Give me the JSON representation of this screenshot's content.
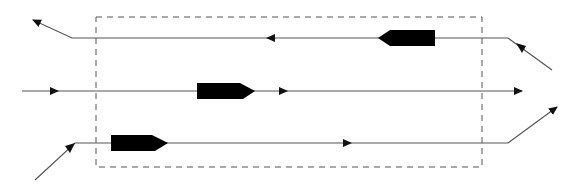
{
  "diagram": {
    "type": "vessel-traffic-lanes",
    "colors": {
      "background": "#ffffff",
      "line": "#555555",
      "ship": "#000000",
      "dashed_box": "#555555"
    },
    "zone": {
      "x": 96,
      "y": 17,
      "width": 386,
      "height": 150,
      "style": "dashed"
    },
    "lanes": [
      {
        "id": "top",
        "direction": "right-to-left",
        "points": [
          [
            552,
            70
          ],
          [
            508,
            38
          ],
          [
            72,
            38
          ],
          [
            33,
            20
          ]
        ],
        "mid_arrows": [
          {
            "x": 270,
            "y": 38,
            "dir": "left"
          }
        ],
        "ship": {
          "x": 378,
          "y": 38,
          "length": 57,
          "heading": "left"
        }
      },
      {
        "id": "middle",
        "direction": "left-to-right",
        "points": [
          [
            22,
            91
          ],
          [
            522,
            91
          ]
        ],
        "mid_arrows": [
          {
            "x": 55,
            "y": 91,
            "dir": "right"
          },
          {
            "x": 285,
            "y": 91,
            "dir": "right"
          }
        ],
        "ship": {
          "x": 197,
          "y": 91,
          "length": 58,
          "heading": "right"
        }
      },
      {
        "id": "bottom",
        "direction": "left-to-right",
        "points": [
          [
            35,
            180
          ],
          [
            75,
            143
          ],
          [
            508,
            143
          ],
          [
            557,
            107
          ]
        ],
        "mid_arrows": [
          {
            "x": 348,
            "y": 143,
            "dir": "right"
          }
        ],
        "ship": {
          "x": 111,
          "y": 143,
          "length": 57,
          "heading": "right"
        }
      }
    ]
  }
}
